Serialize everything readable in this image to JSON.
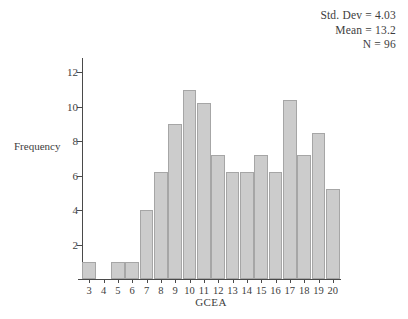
{
  "annotations": {
    "std_dev": "Std. Dev = 4.03",
    "mean": "Mean = 13.2",
    "n": "N = 96"
  },
  "chart_data": {
    "type": "bar",
    "title": "",
    "subtitle": "",
    "xlabel": "GCEA",
    "ylabel": "Frequency",
    "categories": [
      "3",
      "4",
      "5",
      "6",
      "7",
      "8",
      "9",
      "10",
      "11",
      "12",
      "13",
      "14",
      "15",
      "16",
      "17",
      "18",
      "19",
      "20"
    ],
    "values": [
      1,
      0,
      1,
      1,
      4,
      6.2,
      9,
      11,
      10.2,
      7.2,
      6.2,
      6.2,
      7.2,
      6.2,
      10.4,
      7.2,
      8.5,
      5.2
    ],
    "xlim": [
      2.5,
      20.5
    ],
    "ylim": [
      0,
      12.6
    ],
    "y_ticks": [
      2,
      4,
      6,
      8,
      10,
      12
    ],
    "grid": false,
    "legend": false,
    "bar_color": "#cccccc",
    "bar_border_color": "#a6a6a6",
    "axis_color": "#4a4a4a",
    "statistics": {
      "std_dev": 4.03,
      "mean": 13.2,
      "n": 96
    }
  }
}
